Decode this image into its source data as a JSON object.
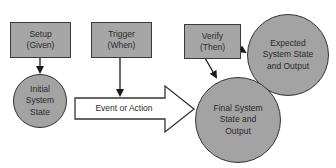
{
  "diagram": {
    "nodes": {
      "setup": {
        "label": "Setup\n(Given)",
        "shape": "rectangle"
      },
      "trigger": {
        "label": "Trigger\n(When)",
        "shape": "rectangle"
      },
      "verify": {
        "label": "Verify\n(Then)",
        "shape": "rectangle"
      },
      "initial_state": {
        "label": "Initial\nSystem\nState",
        "shape": "circle"
      },
      "expected_state": {
        "label": "Expected\nSystem State\nand Output",
        "shape": "circle"
      },
      "final_state": {
        "label": "Final System\nState and\nOutput",
        "shape": "circle"
      }
    },
    "event_arrow": {
      "label": "Event or Action"
    },
    "edges": [
      {
        "from": "setup",
        "to": "initial_state"
      },
      {
        "from": "trigger",
        "to": "event_arrow"
      },
      {
        "from": "initial_state",
        "to": "final_state",
        "via": "event_arrow"
      },
      {
        "from": "verify",
        "to": "expected_state"
      },
      {
        "from": "verify",
        "to": "final_state"
      }
    ],
    "colors": {
      "fill": "#a6a6a6",
      "stroke": "#333333",
      "arrow_fill": "#ffffff",
      "text": "#2a2a2a"
    }
  }
}
